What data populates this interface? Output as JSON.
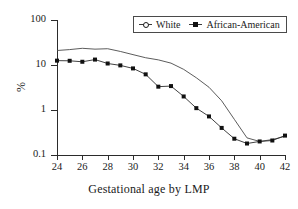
{
  "chart_data": {
    "type": "line",
    "title": "",
    "xlabel": "Gestational age by LMP",
    "ylabel": "%",
    "yscale": "log",
    "ylim": [
      0.1,
      100
    ],
    "xlim": [
      24,
      42
    ],
    "grid": false,
    "legend_position": "top-right",
    "x": [
      24,
      25,
      26,
      27,
      28,
      29,
      30,
      31,
      32,
      33,
      34,
      35,
      36,
      37,
      38,
      39,
      40,
      41,
      42
    ],
    "xticks": [
      "24",
      "26",
      "28",
      "30",
      "32",
      "34",
      "36",
      "38",
      "40",
      "42"
    ],
    "yticks": [
      "100",
      "10",
      "1",
      "0.1"
    ],
    "series": [
      {
        "name": "White",
        "marker": "open-circle",
        "values": [
          21.0,
          22.0,
          23.5,
          22.5,
          23.0,
          20.0,
          17.0,
          14.5,
          13.0,
          11.0,
          8.0,
          5.2,
          3.2,
          1.6,
          0.62,
          0.24,
          0.2,
          0.22,
          0.26
        ]
      },
      {
        "name": "African-American",
        "marker": "filled-square",
        "values": [
          12.5,
          12.4,
          11.8,
          13.2,
          10.8,
          9.8,
          8.4,
          6.2,
          3.3,
          3.4,
          2.0,
          1.1,
          0.72,
          0.4,
          0.23,
          0.18,
          0.2,
          0.21,
          0.27
        ]
      }
    ]
  },
  "legend": {
    "entries": [
      {
        "label": "White"
      },
      {
        "label": "African-American"
      }
    ]
  },
  "axes": {
    "y_tick_labels": [
      "100",
      "10",
      "1",
      "0.1"
    ],
    "x_tick_labels": [
      "24",
      "26",
      "28",
      "30",
      "32",
      "34",
      "36",
      "38",
      "40",
      "42"
    ],
    "x_axis_title": "Gestational age by LMP",
    "y_axis_title": "%"
  }
}
